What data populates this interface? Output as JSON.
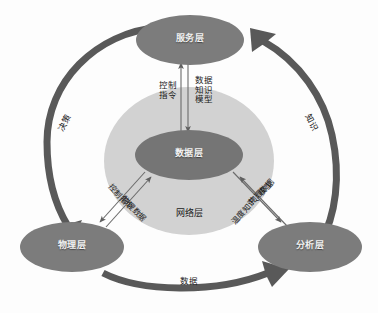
{
  "diagram": {
    "colors": {
      "node_fill": "#7f7f7f",
      "node_fill_dark": "#737373",
      "ring_fill": "#d0d0d0",
      "arc_stroke": "#595959",
      "thin_arrow": "#6b6b6b",
      "background": "#fdfdfd",
      "node_text": "#f2f2f2",
      "label_text": "#1a1a1a"
    },
    "nodes": [
      {
        "id": "service",
        "label": "服务层"
      },
      {
        "id": "data",
        "label": "数据层"
      },
      {
        "id": "physical",
        "label": "物理层"
      },
      {
        "id": "analysis",
        "label": "分析层"
      }
    ],
    "ring_label": "网络层",
    "outer_arcs": [
      {
        "id": "arc-left",
        "label": "决策",
        "from": "service",
        "to": "physical"
      },
      {
        "id": "arc-bottom",
        "label": "数据",
        "from": "physical",
        "to": "analysis"
      },
      {
        "id": "arc-right",
        "label": "知识",
        "from": "analysis",
        "to": "service"
      }
    ],
    "inner_labels": [
      {
        "id": "control-cmd-up",
        "label": "控制\n指令"
      },
      {
        "id": "data-know-model",
        "label": "数据\n知识\n模型"
      },
      {
        "id": "control-cmd-left",
        "label": "控制指令"
      },
      {
        "id": "phys-data-left",
        "label": "物理数据"
      },
      {
        "id": "phys-data-right",
        "label": "物理数据"
      },
      {
        "id": "temp-know-model",
        "label": "温度知识、模型"
      }
    ]
  }
}
